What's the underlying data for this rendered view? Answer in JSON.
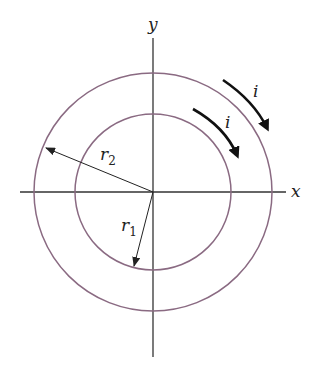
{
  "figure": {
    "axes": {
      "x_label": "x",
      "y_label": "y"
    },
    "circles": [
      {
        "name": "inner",
        "radius_label": "r",
        "radius_sub": "1",
        "color": "#8a6a82"
      },
      {
        "name": "outer",
        "radius_label": "r",
        "radius_sub": "2",
        "color": "#8a6a82"
      }
    ],
    "currents": [
      {
        "label": "i",
        "direction": "clockwise",
        "ring": "inner"
      },
      {
        "label": "i",
        "direction": "clockwise",
        "ring": "outer"
      }
    ],
    "colors": {
      "axis": "#333333",
      "circle": "#8a6a82",
      "arrow": "#111111"
    }
  }
}
